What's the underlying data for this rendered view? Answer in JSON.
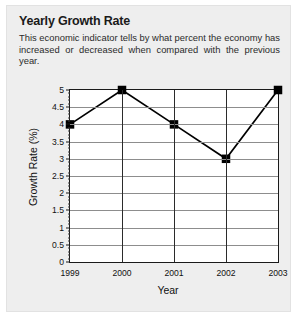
{
  "card": {
    "title": "Yearly Growth Rate",
    "subtitle": "This economic indicator tells by what percent the economy has increased or decreased when compared with the previous year."
  },
  "colors": {
    "card_background": "#eeeeee",
    "plot_background": "#ffffff",
    "axis": "#1a1a1a",
    "gridline": "#8d8d8d",
    "series_line": "#000000",
    "marker": "#000000",
    "title_text": "#1a1a1a",
    "body_text": "#2b2b2b"
  },
  "chart_data": {
    "type": "line",
    "title": "Yearly Growth Rate",
    "subtitle": "This economic indicator tells by what percent the economy has increased or decreased when compared with the previous year.",
    "xlabel": "Year",
    "ylabel": "Growth Rate (%)",
    "categories": [
      "1999",
      "2000",
      "2001",
      "2002",
      "2003"
    ],
    "values": [
      4,
      5,
      4,
      3,
      5
    ],
    "series": [
      {
        "name": "Growth Rate",
        "values": [
          4,
          5,
          4,
          3,
          5
        ]
      }
    ],
    "ylim": [
      0,
      5
    ],
    "ytick_labels": [
      "0",
      "0.5",
      "1",
      "1.5",
      "2",
      "2.5",
      "3",
      "3.5",
      "4",
      "4.5",
      "5"
    ],
    "ytick_values": [
      0,
      0.5,
      1,
      1.5,
      2,
      2.5,
      3,
      3.5,
      4,
      4.5,
      5
    ],
    "ytick_minor_step": 0.1,
    "xtick_labels": [
      "1999",
      "2000",
      "2001",
      "2002",
      "2003"
    ],
    "grid": {
      "horizontal": true,
      "vertical": true
    },
    "legend": null,
    "marker_style": "square",
    "annotations": []
  }
}
